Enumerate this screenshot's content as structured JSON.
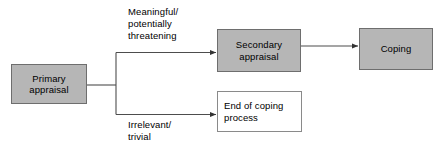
{
  "diagram": {
    "colors": {
      "node_fill": "#b6b6b6",
      "node_border": "#6e6e6e",
      "outline_fill": "#ffffff",
      "outline_border": "#8a8a8a",
      "edge_stroke": "#4d4d4d",
      "text": "#000000",
      "background": "#ffffff"
    },
    "nodes": [
      {
        "id": "primary",
        "label": "Primary\nappraisal",
        "style": "filled"
      },
      {
        "id": "secondary",
        "label": "Secondary\nappraisal",
        "style": "filled"
      },
      {
        "id": "coping",
        "label": "Coping",
        "style": "filled"
      },
      {
        "id": "end_of_coping",
        "label": "End of coping\nprocess",
        "style": "outline"
      }
    ],
    "edges": [
      {
        "id": "primary-to-secondary",
        "from": "primary",
        "to": "secondary",
        "label": "Meaningful/\npotentially\nthreatening",
        "arrow": "arrow-head-icon"
      },
      {
        "id": "primary-to-end-of-coping",
        "from": "primary",
        "to": "end_of_coping",
        "label": "Irrelevant/\ntrivial",
        "arrow": "arrow-head-icon"
      },
      {
        "id": "secondary-to-coping",
        "from": "secondary",
        "to": "coping",
        "label": "",
        "arrow": "arrow-head-icon"
      }
    ]
  }
}
